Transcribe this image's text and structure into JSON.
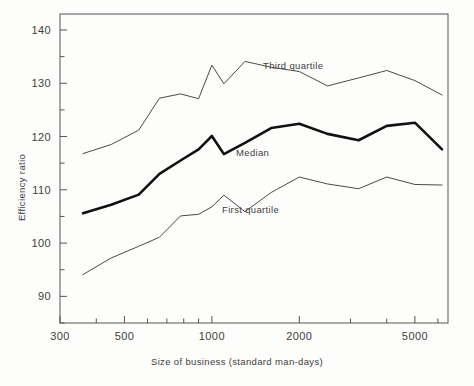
{
  "chart_data": {
    "type": "line",
    "title": "",
    "xlabel": "Size of business (standard man-days)",
    "ylabel": "Efficiency ratio",
    "xscale": "log",
    "xlim": [
      300,
      6500
    ],
    "ylim": [
      85,
      143
    ],
    "grid": false,
    "legend_position": "inline-annotations",
    "x_tick_labels": [
      "300",
      "500",
      "1000",
      "2000",
      "5000"
    ],
    "x_tick_values": [
      300,
      500,
      1000,
      2000,
      5000
    ],
    "x_minor_ticks": [
      400,
      600,
      700,
      800,
      900,
      3000,
      4000,
      6000
    ],
    "y_tick_labels": [
      "140",
      "130",
      "120",
      "110",
      "100",
      "90"
    ],
    "y_tick_values": [
      140,
      130,
      120,
      110,
      100,
      90
    ],
    "y_minor_ticks": [
      135,
      125,
      115,
      105,
      95,
      85
    ],
    "x": [
      360,
      450,
      560,
      660,
      780,
      900,
      1000,
      1100,
      1300,
      1600,
      2000,
      2500,
      3200,
      4000,
      5000,
      6200
    ],
    "series": [
      {
        "name": "Third quartile",
        "label": "Third quartile",
        "color": "#4a4a4a",
        "width": 1.0,
        "values": [
          116.8,
          118.5,
          121.2,
          127.2,
          128.0,
          127.1,
          133.4,
          129.9,
          134.1,
          133.0,
          132.2,
          129.5,
          131.0,
          132.4,
          130.5,
          127.8
        ]
      },
      {
        "name": "Median",
        "label": "Median",
        "color": "#111111",
        "width": 2.6,
        "values": [
          105.6,
          107.2,
          109.1,
          113.0,
          115.5,
          117.6,
          120.1,
          116.7,
          118.8,
          121.6,
          122.4,
          120.5,
          119.3,
          122.0,
          122.6,
          117.6
        ]
      },
      {
        "name": "First quartile",
        "label": "First quartile",
        "color": "#4a4a4a",
        "width": 1.0,
        "values": [
          94.1,
          97.2,
          99.4,
          101.1,
          105.1,
          105.4,
          106.8,
          109.0,
          105.9,
          109.5,
          112.4,
          111.1,
          110.2,
          112.4,
          111.0,
          110.9
        ]
      }
    ],
    "annotations": [
      {
        "text": "Third quartile",
        "x_px": 263,
        "y_px": 69,
        "series": "Third quartile"
      },
      {
        "text": "Median",
        "x_px": 236,
        "y_px": 156,
        "series": "Median"
      },
      {
        "text": "First quartile",
        "x_px": 222,
        "y_px": 213,
        "series": "First quartile"
      }
    ]
  },
  "axes": {
    "x_title": "Size of business (standard man-days)",
    "y_title": "Efficiency ratio"
  }
}
